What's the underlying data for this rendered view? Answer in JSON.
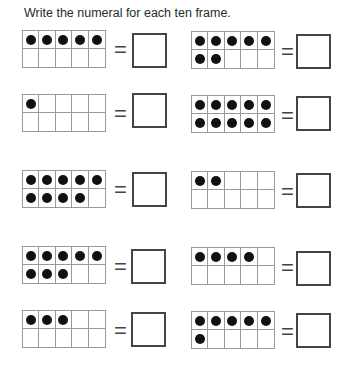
{
  "worksheet": {
    "instruction": "Write the numeral for each ten frame.",
    "equals_sign": "=",
    "frames": [
      {
        "dots": 5,
        "answer": ""
      },
      {
        "dots": 7,
        "answer": ""
      },
      {
        "dots": 1,
        "answer": ""
      },
      {
        "dots": 10,
        "answer": ""
      },
      {
        "dots": 9,
        "answer": ""
      },
      {
        "dots": 2,
        "answer": ""
      },
      {
        "dots": 8,
        "answer": ""
      },
      {
        "dots": 4,
        "answer": ""
      },
      {
        "dots": 3,
        "answer": ""
      },
      {
        "dots": 6,
        "answer": ""
      }
    ]
  },
  "colors": {
    "dot": "#111111",
    "grid": "#9a9a9a",
    "box": "#444444"
  }
}
